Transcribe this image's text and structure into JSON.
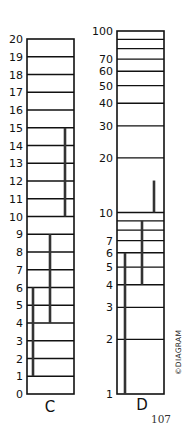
{
  "chart_data": [
    {
      "type": "bar",
      "id": "C",
      "title": "C",
      "scale": "linear",
      "ylim": [
        0,
        20
      ],
      "ticks": [
        0,
        1,
        2,
        3,
        4,
        5,
        6,
        7,
        8,
        9,
        10,
        11,
        12,
        13,
        14,
        15,
        16,
        17,
        18,
        19,
        20
      ],
      "tick_labels": [
        "0",
        "1",
        "2",
        "3",
        "4",
        "5",
        "6",
        "7",
        "8",
        "9",
        "10",
        "11",
        "12",
        "13",
        "14",
        "15",
        "16",
        "17",
        "18",
        "19",
        "20"
      ],
      "bars": [
        {
          "from": 1,
          "to": 6
        },
        {
          "from": 4,
          "to": 9
        },
        {
          "from": 10,
          "to": 15
        }
      ],
      "grid": true
    },
    {
      "type": "bar",
      "id": "D",
      "title": "D",
      "scale": "log",
      "ylim": [
        1,
        100
      ],
      "gridlines": [
        1,
        2,
        3,
        4,
        5,
        6,
        7,
        8,
        9,
        10,
        20,
        30,
        40,
        50,
        60,
        70,
        80,
        90,
        100
      ],
      "ticks": [
        1,
        2,
        3,
        4,
        5,
        6,
        7,
        10,
        20,
        30,
        40,
        50,
        60,
        70,
        100
      ],
      "tick_labels": [
        "1",
        "2",
        "3",
        "4",
        "5",
        "6",
        "7",
        "10",
        "20",
        "30",
        "40",
        "50",
        "60",
        "70",
        "100"
      ],
      "bars": [
        {
          "from": 1,
          "to": 6
        },
        {
          "from": 4,
          "to": 9
        },
        {
          "from": 10,
          "to": 15
        }
      ],
      "grid": true
    }
  ],
  "labels": {
    "chart_c": "C",
    "chart_d": "D",
    "credit": "©DIAGRAM",
    "page_number": "107"
  },
  "colors": {
    "ink": "#111111",
    "background": "#ffffff"
  }
}
